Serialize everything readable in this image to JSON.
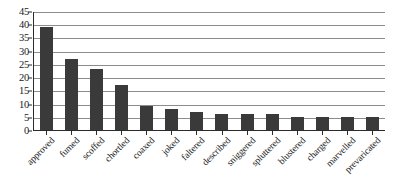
{
  "chart_data": {
    "type": "bar",
    "title": "",
    "xlabel": "",
    "ylabel": "",
    "ylim": [
      0,
      45
    ],
    "yticks": [
      0,
      5,
      10,
      15,
      20,
      25,
      30,
      35,
      40,
      45
    ],
    "grid": true,
    "legend": false,
    "bar_color": "#3a3a3a",
    "categories": [
      "approved",
      "fumed",
      "scoffed",
      "chortled",
      "coaxed",
      "joked",
      "faltered",
      "described",
      "sniggered",
      "spluttered",
      "blustered",
      "charged",
      "marvelled",
      "prevaricated"
    ],
    "values": [
      39,
      27,
      23,
      17,
      9,
      8,
      7,
      6,
      6,
      6,
      5,
      5,
      5,
      5
    ]
  }
}
